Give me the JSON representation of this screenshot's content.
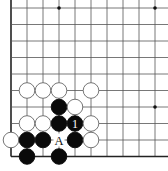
{
  "diagram": {
    "type": "go-board-corner",
    "corner": "bottom-left",
    "grid": {
      "columns": 10,
      "rows": 10,
      "x0": 11,
      "y0": 8,
      "spacing_x": 16.0,
      "spacing_y": 16.5,
      "edge_left": true,
      "edge_bottom": true,
      "line_color": "#555555",
      "edge_color": "#222222"
    },
    "star_points": [
      {
        "col": 3,
        "row": 0
      },
      {
        "col": 9,
        "row": 0
      },
      {
        "col": 9,
        "row": 6
      }
    ],
    "stones": [
      {
        "color": "white",
        "col": 1,
        "row": 5
      },
      {
        "color": "white",
        "col": 2,
        "row": 5
      },
      {
        "color": "white",
        "col": 3,
        "row": 5
      },
      {
        "color": "white",
        "col": 5,
        "row": 5
      },
      {
        "color": "black",
        "col": 3,
        "row": 6
      },
      {
        "color": "white",
        "col": 4,
        "row": 6
      },
      {
        "color": "white",
        "col": 1,
        "row": 7
      },
      {
        "color": "white",
        "col": 2,
        "row": 7
      },
      {
        "color": "black",
        "col": 3,
        "row": 7
      },
      {
        "color": "black",
        "col": 4,
        "row": 7,
        "label": "1"
      },
      {
        "color": "white",
        "col": 5,
        "row": 7
      },
      {
        "color": "white",
        "col": 0,
        "row": 8
      },
      {
        "color": "black",
        "col": 1,
        "row": 8
      },
      {
        "color": "black",
        "col": 2,
        "row": 8
      },
      {
        "color": "black",
        "col": 4,
        "row": 8
      },
      {
        "color": "white",
        "col": 5,
        "row": 8
      },
      {
        "color": "black",
        "col": 1,
        "row": 9
      },
      {
        "color": "black",
        "col": 3,
        "row": 9
      }
    ],
    "point_labels": [
      {
        "text": "A",
        "col": 3,
        "row": 8
      }
    ]
  }
}
